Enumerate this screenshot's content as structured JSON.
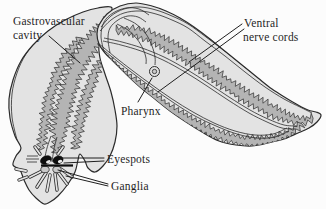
{
  "labels": {
    "gastrovascular_line1": "Gastrovascular",
    "gastrovascular_line2": "cavity",
    "ventral_line1": "Ventral",
    "ventral_line2": "nerve cords",
    "pharynx": "Pharynx",
    "eyespots": "Eyespots",
    "ganglia": "Ganglia"
  },
  "colors": {
    "background": "#fcfcfc",
    "body_fill": "#e3e3e3",
    "cavity_fill": "#b4b4b4",
    "outline": "#2b2b2b",
    "eyespot": "#0d0d0d",
    "ganglia_fill": "#c9c9c9",
    "text": "#1f1f1f"
  }
}
